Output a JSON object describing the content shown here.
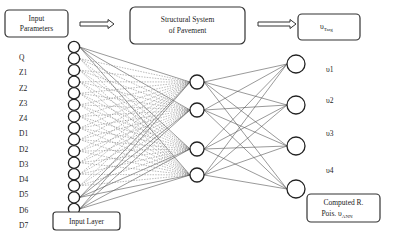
{
  "boxes": {
    "input_parameters": {
      "line1": "Input",
      "line2": "Parameters"
    },
    "structural_system": {
      "line1": "Structural System",
      "line2": "of Pavement"
    },
    "target": {
      "symbol": "υ",
      "subscript": "Targ"
    },
    "input_layer": {
      "label": "Input Layer"
    },
    "computed": {
      "line1": "Computed R.",
      "line2": "Pois. υ",
      "subscript": "ANN"
    }
  },
  "input_labels": [
    "Q",
    "Z1",
    "Z2",
    "Z3",
    "Z4",
    "D1",
    "D2",
    "D3",
    "D4",
    "D5",
    "D6",
    "D7"
  ],
  "output_labels": [
    "υ1",
    "υ2",
    "υ3",
    "υ4"
  ],
  "layers": {
    "input_node_count": 15,
    "hidden_node_count": 4,
    "output_node_count": 4
  },
  "colors": {
    "stroke": "#222222",
    "edge": "#555555",
    "background": "#ffffff"
  }
}
